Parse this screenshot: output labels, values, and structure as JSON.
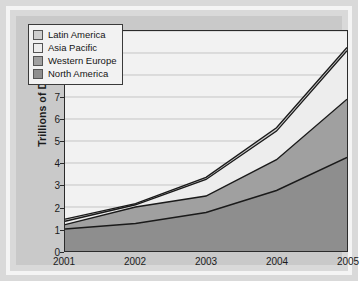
{
  "chart_data": {
    "type": "area",
    "stacked": true,
    "title": "",
    "xlabel": "",
    "ylabel": "Trillions of Dollars",
    "categories": [
      "2001",
      "2002",
      "2003",
      "2004",
      "2005"
    ],
    "x_tick_labels": [
      "2001",
      "2002",
      "2003",
      "2004",
      "2005"
    ],
    "y_tick_labels": [
      "0",
      "1",
      "2",
      "3",
      "4",
      "5",
      "6",
      "7",
      "8",
      "9",
      "10"
    ],
    "ylim": [
      0,
      10
    ],
    "y_tick_step": 1,
    "grid": true,
    "grid_axis": "y",
    "legend_position": "top-left",
    "series": [
      {
        "name": "North America",
        "color": "#8e8e8e",
        "values": [
          1.0,
          1.25,
          1.75,
          2.75,
          4.25
        ]
      },
      {
        "name": "Western Europe",
        "color": "#a0a0a0",
        "values": [
          0.2,
          0.75,
          0.75,
          1.4,
          2.65
        ]
      },
      {
        "name": "Asia Pacific",
        "color": "#ededed",
        "values": [
          0.15,
          0.1,
          0.75,
          1.3,
          2.2
        ]
      },
      {
        "name": "Latin America",
        "color": "#cfcfcf",
        "values": [
          0.1,
          0.05,
          0.1,
          0.15,
          0.15
        ]
      }
    ],
    "stack_tops": {
      "north_america": [
        1.0,
        1.25,
        1.75,
        2.75,
        4.25
      ],
      "western_europe": [
        1.2,
        2.0,
        2.5,
        4.15,
        6.9
      ],
      "asia_pacific": [
        1.35,
        2.1,
        3.25,
        5.45,
        9.1
      ],
      "latin_america": [
        1.45,
        2.15,
        3.35,
        5.6,
        9.25
      ]
    }
  },
  "legend": {
    "items": [
      {
        "label": "Latin America",
        "color": "#cfcfcf"
      },
      {
        "label": "Asia Pacific",
        "color": "#ededed"
      },
      {
        "label": "Western Europe",
        "color": "#a0a0a0"
      },
      {
        "label": "North America",
        "color": "#8e8e8e"
      }
    ]
  },
  "axes": {
    "y_title": "Trillions of Dollars"
  },
  "colors": {
    "panel_background": "#c9c9c9",
    "plot_background": "#f2f2f2",
    "outer_background": "#d9d9d9",
    "frame": "#f4f4f4",
    "axis_line": "#2b2b2b",
    "grid_line": "#b9b9b9",
    "series_outline": "#1a1a1a"
  }
}
